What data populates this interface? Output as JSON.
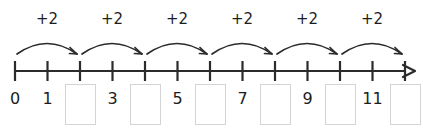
{
  "worksheet": {
    "title": "Number line skip counting by twos",
    "type": "number-line-fill-in-the-blank"
  },
  "style": {
    "line_color": "#2b2b2b",
    "arc_color": "#2b2b2b",
    "text_color": "#1d1d1d",
    "box_border_color": "#d4d4d4",
    "background_color": "#ffffff"
  },
  "number_line": {
    "start_x": 15,
    "end_x": 415,
    "baseline_y": 71,
    "tick_spacing": 32.5,
    "tick_top": 61,
    "tick_bottom": 81,
    "tick_count": 13,
    "has_right_arrowhead": true,
    "positions": [
      0,
      1,
      2,
      3,
      4,
      5,
      6,
      7,
      8,
      9,
      10,
      11,
      12
    ]
  },
  "jumps": [
    {
      "label": "+2",
      "from": 0,
      "to": 2
    },
    {
      "label": "+2",
      "from": 2,
      "to": 4
    },
    {
      "label": "+2",
      "from": 4,
      "to": 6
    },
    {
      "label": "+2",
      "from": 6,
      "to": 8
    },
    {
      "label": "+2",
      "from": 8,
      "to": 10
    },
    {
      "label": "+2",
      "from": 10,
      "to": 12
    }
  ],
  "labels": [
    {
      "position": 0,
      "kind": "number",
      "value": "0"
    },
    {
      "position": 1,
      "kind": "number",
      "value": "1"
    },
    {
      "position": 2,
      "kind": "blank",
      "value": ""
    },
    {
      "position": 3,
      "kind": "number",
      "value": "3"
    },
    {
      "position": 4,
      "kind": "blank",
      "value": ""
    },
    {
      "position": 5,
      "kind": "number",
      "value": "5"
    },
    {
      "position": 6,
      "kind": "blank",
      "value": ""
    },
    {
      "position": 7,
      "kind": "number",
      "value": "7"
    },
    {
      "position": 8,
      "kind": "blank",
      "value": ""
    },
    {
      "position": 9,
      "kind": "number",
      "value": "9"
    },
    {
      "position": 10,
      "kind": "blank",
      "value": ""
    },
    {
      "position": 11,
      "kind": "number",
      "value": "11"
    },
    {
      "position": 12,
      "kind": "blank",
      "value": ""
    }
  ]
}
